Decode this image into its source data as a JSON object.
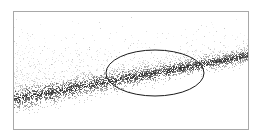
{
  "figure": {
    "title": "",
    "caption": "",
    "background_color": "#ffffff",
    "frame": {
      "border_color": "#a8a8a8",
      "border_width_px": 1,
      "x": 13,
      "y": 11,
      "width": 236,
      "height": 119
    }
  },
  "chart_data": {
    "type": "scatter",
    "title": "",
    "subtitle": "",
    "xlabel": "",
    "ylabel": "",
    "xlim": [
      0,
      1
    ],
    "ylim": [
      0,
      1
    ],
    "grid": false,
    "legend": null,
    "axis_ticks": {
      "x": [],
      "y": []
    },
    "point_color": "#555555",
    "point_size_px": 1,
    "n_points_total": 4200,
    "series": [
      {
        "name": "dense-band",
        "description": "Narrow high-density diagonal band of points rising from lower-left to upper-right",
        "n_points": 2400,
        "point_color": "#3a3a3a",
        "opacity": 0.85,
        "band_start": {
          "x": 0.0,
          "y": 0.74
        },
        "band_end": {
          "x": 1.0,
          "y": 0.37
        },
        "band_half_thickness_start": 0.055,
        "band_half_thickness_end": 0.03
      },
      {
        "name": "diffuse-cloud",
        "description": "Sparse low-density cloud spread above and around the band, densest toward upper-left",
        "n_points": 1800,
        "point_color": "#9a9a9a",
        "opacity": 0.5,
        "x_range": [
          0.0,
          1.0
        ],
        "y_range": [
          0.0,
          0.85
        ],
        "density_peak": {
          "x": 0.12,
          "y": 0.32
        }
      }
    ],
    "annotations": [
      {
        "name": "highlight-ellipse",
        "type": "ellipse",
        "label": "",
        "stroke_color": "#1a1a1a",
        "stroke_width_px": 1,
        "fill": "none",
        "center": {
          "x": 155,
          "y": 73
        },
        "radius_x": 49,
        "radius_y": 23,
        "rotation_deg": 0
      }
    ]
  },
  "accessibility": {
    "alt_text": "Scatter plot showing a dense diagonal band of points with an ellipse highlighting a region of the band"
  }
}
